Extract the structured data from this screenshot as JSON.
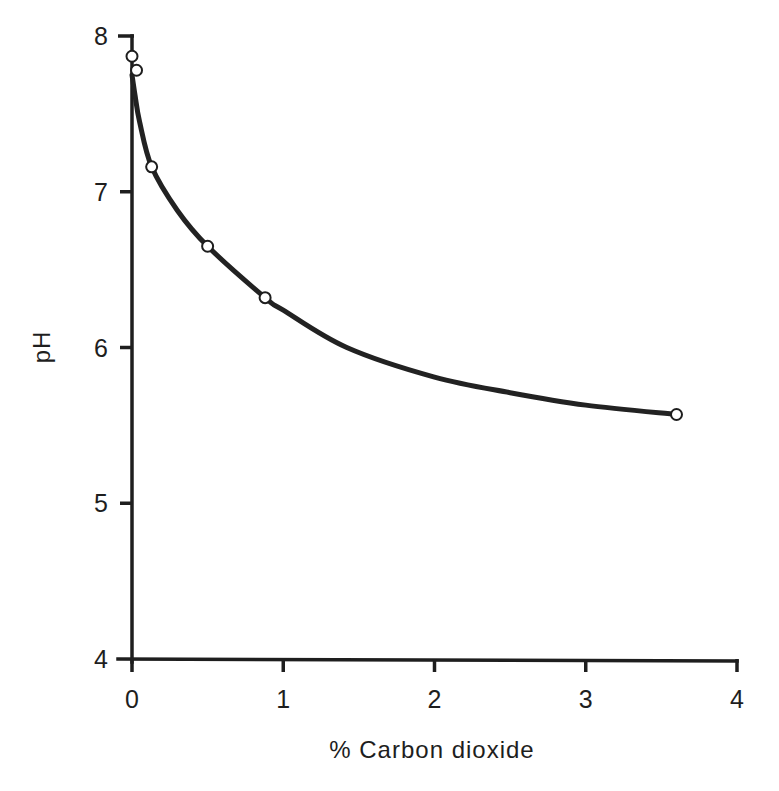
{
  "chart_data": {
    "type": "line",
    "title": "",
    "xlabel": "% Carbon dioxide",
    "ylabel": "pH",
    "xlim": [
      0,
      4
    ],
    "ylim": [
      4,
      8
    ],
    "x_ticks": [
      "0",
      "1",
      "2",
      "3",
      "4"
    ],
    "y_ticks": [
      "4",
      "5",
      "6",
      "7",
      "8"
    ],
    "grid": false,
    "legend": null,
    "series": [
      {
        "name": "measured pH",
        "marker": "open-circle",
        "x": [
          0.0,
          0.03,
          0.13,
          0.5,
          0.88,
          3.6
        ],
        "values": [
          7.87,
          7.78,
          7.16,
          6.65,
          6.32,
          5.57
        ]
      },
      {
        "name": "fitted curve",
        "marker": "none",
        "x": [
          0.0,
          0.02,
          0.05,
          0.13,
          0.3,
          0.5,
          0.88,
          1.0,
          1.42,
          2.0,
          2.5,
          3.0,
          3.6
        ],
        "values": [
          7.75,
          7.62,
          7.45,
          7.16,
          6.88,
          6.65,
          6.32,
          6.24,
          6.0,
          5.81,
          5.71,
          5.63,
          5.57
        ]
      }
    ]
  },
  "axes": {
    "x_title": "% Carbon dioxide",
    "y_title": "pH"
  }
}
